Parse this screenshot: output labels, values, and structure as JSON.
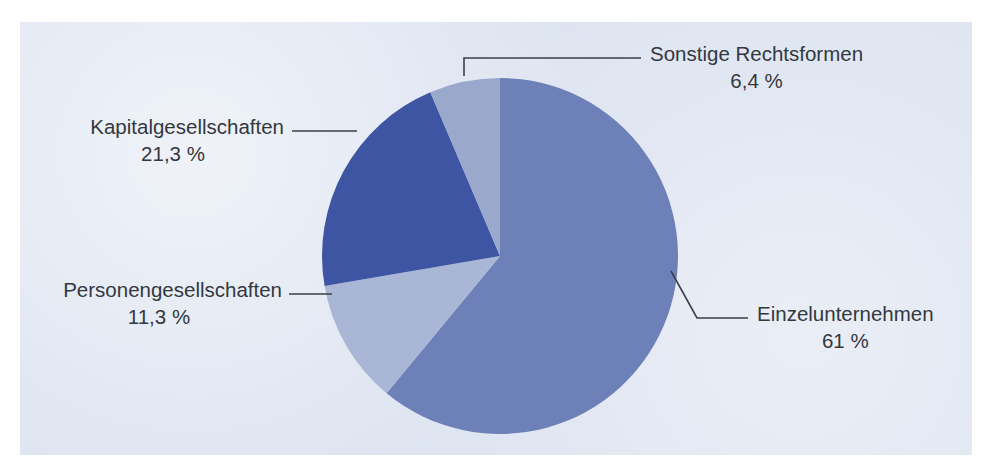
{
  "chart_data": {
    "type": "pie",
    "title": "",
    "xlabel": "",
    "ylabel": "",
    "legend_position": "callout-labels",
    "grid": false,
    "unit": "%",
    "start_angle_deg": 0,
    "direction": "clockwise",
    "categories": [
      "Einzelunternehmen",
      "Personengesellschaften",
      "Kapitalgesellschaften",
      "Sonstige Rechtsformen"
    ],
    "values": [
      61,
      11.3,
      21.3,
      6.4
    ],
    "value_labels": [
      "61 %",
      "11,3 %",
      "21,3 %",
      "6,4 %"
    ],
    "colors": [
      "#6d80b8",
      "#aab6d6",
      "#3e55a3",
      "#9aa8cc"
    ],
    "slices": [
      {
        "name": "Einzelunternehmen",
        "value": 61,
        "value_label": "61 %",
        "color": "#6d80b8",
        "start_deg": 0,
        "end_deg": 219.6,
        "label_side": "right"
      },
      {
        "name": "Personengesellschaften",
        "value": 11.3,
        "value_label": "11,3 %",
        "color": "#aab6d6",
        "start_deg": 219.6,
        "end_deg": 260.28,
        "label_side": "left"
      },
      {
        "name": "Kapitalgesellschaften",
        "value": 21.3,
        "value_label": "21,3 %",
        "color": "#3e55a3",
        "start_deg": 260.28,
        "end_deg": 337.0,
        "label_side": "left"
      },
      {
        "name": "Sonstige Rechtsformen",
        "value": 6.4,
        "value_label": "6,4 %",
        "color": "#9aa8cc",
        "start_deg": 337.0,
        "end_deg": 360,
        "label_side": "right"
      }
    ]
  },
  "labels": {
    "sonstige": {
      "name": "Sonstige Rechtsformen",
      "pct": "6,4 %"
    },
    "kapital": {
      "name": "Kapitalgesellschaften",
      "pct": "21,3 %"
    },
    "personen": {
      "name": "Personengesellschaften",
      "pct": "11,3 %"
    },
    "einzel": {
      "name": "Einzelunternehmen",
      "pct": "61 %"
    }
  },
  "page": {
    "background_color": "#dce3f0",
    "text_color": "#33383f"
  }
}
